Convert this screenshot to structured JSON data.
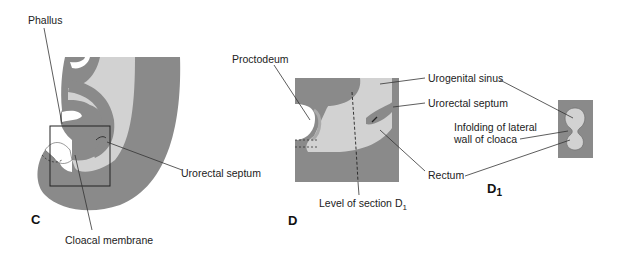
{
  "figure": {
    "panels": [
      {
        "id": "C",
        "label": "C"
      },
      {
        "id": "D",
        "label": "D"
      },
      {
        "id": "D1",
        "label": "D",
        "subscript": "1"
      }
    ],
    "labels": {
      "phallus": "Phallus",
      "urorectal_septum_c": "Urorectal septum",
      "cloacal_membrane": "Cloacal membrane",
      "proctodeum": "Proctodeum",
      "urogenital_sinus": "Urogenital sinus",
      "urorectal_septum_d": "Urorectal septum",
      "infolding_line1": "Infolding of lateral",
      "infolding_line2": "wall of cloaca",
      "rectum": "Rectum",
      "level_of_section": "Level of section D",
      "level_sub": "1"
    },
    "colors": {
      "dark_tissue": "#8a8a8a",
      "light_tissue": "#d2d2d2",
      "outline": "#555555",
      "line": "#333333"
    }
  }
}
